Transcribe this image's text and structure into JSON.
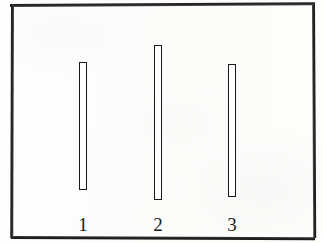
{
  "figure": {
    "background_color": "#fdfdfc",
    "frame_color": "#1b1b1b",
    "bar_outline_color": "#1a1a1a",
    "bar_fill_color": "#ffffff"
  },
  "chart_data": {
    "type": "bar",
    "title": "",
    "subtitle": "",
    "xlabel": "",
    "ylabel": "",
    "categories": [
      "1",
      "2",
      "3"
    ],
    "values": [
      128,
      155,
      133
    ],
    "ylim": [
      0,
      196
    ],
    "grid": false,
    "legend": null,
    "annotations": [],
    "bars": [
      {
        "label": "1",
        "value": 128,
        "center_x": 83,
        "top_y": 62,
        "bottom_y": 190,
        "width": 8,
        "style": "hollow-outline"
      },
      {
        "label": "2",
        "value": 155,
        "center_x": 158,
        "top_y": 45,
        "bottom_y": 200,
        "width": 8,
        "style": "hollow-outline"
      },
      {
        "label": "3",
        "value": 133,
        "center_x": 232,
        "top_y": 64,
        "bottom_y": 197,
        "width": 8,
        "style": "hollow-outline"
      }
    ],
    "tick_labels": [
      "1",
      "2",
      "3"
    ],
    "tick_label_y": 215
  }
}
